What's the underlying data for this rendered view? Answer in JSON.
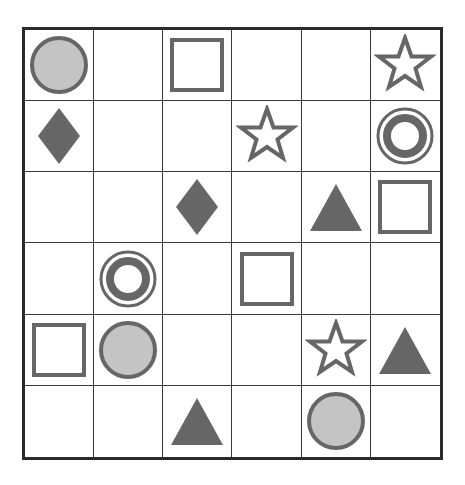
{
  "board": {
    "rows": 6,
    "cols": 6,
    "colors": {
      "stroke": "#666666",
      "fill_dark": "#666666",
      "fill_light": "#c4c4c4",
      "grid_line": "#3a3a3a",
      "border": "#2a2a2a"
    },
    "cells": [
      [
        "circle-icon",
        "",
        "square-icon",
        "",
        "",
        "star-icon"
      ],
      [
        "diamond-icon",
        "",
        "",
        "star-icon",
        "",
        "ring-icon"
      ],
      [
        "",
        "",
        "diamond-icon",
        "",
        "triangle-icon",
        "square-icon"
      ],
      [
        "",
        "ring-icon",
        "",
        "square-icon",
        "",
        ""
      ],
      [
        "square-icon",
        "circle-icon",
        "",
        "",
        "star-icon",
        "triangle-icon"
      ],
      [
        "",
        "",
        "triangle-icon",
        "",
        "circle-icon",
        ""
      ]
    ]
  }
}
